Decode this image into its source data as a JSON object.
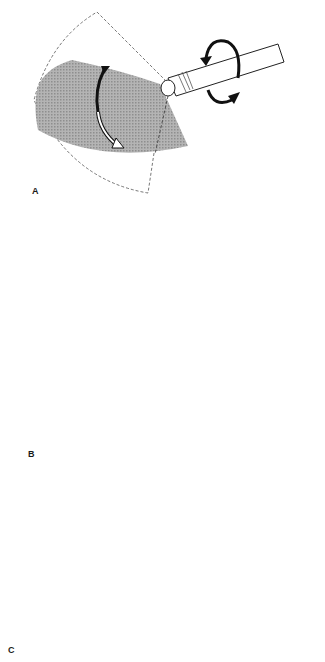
{
  "figure": {
    "panels": [
      {
        "id": "A",
        "label": "A",
        "description": "Probe tip rotation (torque) and tip deflection sweeping the imaging sector"
      },
      {
        "id": "B",
        "label": "B",
        "description": "Up/down tip angulation moving the imaging sector"
      },
      {
        "id": "C",
        "label": "C",
        "description": "Advance/withdraw probe shifting the imaging sector"
      }
    ],
    "colors": {
      "sector_fill": "#a9a9a9",
      "outline": "#333333",
      "background": "#ffffff"
    },
    "icons": {
      "rotation_arrows": "circular-rotation-arrows",
      "curved_double_arrow": "curved-double-arrow",
      "hollow_arrow": "hollow-block-arrow",
      "small_arrow": "small-black-arrow"
    }
  }
}
